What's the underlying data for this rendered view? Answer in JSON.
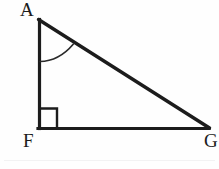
{
  "figure": {
    "kind": "geometry-diagram",
    "background_color": "#fefefe",
    "stroke_color": "#1c1c1c",
    "stroke_width": 3,
    "canvas": {
      "width": 219,
      "height": 169
    },
    "vertices": [
      {
        "id": "A",
        "label": "A",
        "x": 38,
        "y": 19,
        "label_x": 20,
        "label_y": 0
      },
      {
        "id": "F",
        "label": "F",
        "x": 38,
        "y": 128,
        "label_x": 23,
        "label_y": 131
      },
      {
        "id": "G",
        "label": "G",
        "x": 209,
        "y": 128,
        "label_x": 204,
        "label_y": 131
      }
    ],
    "segments": [
      {
        "name": "leg-AF",
        "from": "A",
        "to": "F"
      },
      {
        "name": "leg-FG",
        "from": "F",
        "to": "G"
      },
      {
        "name": "hypotenuse-AG",
        "from": "A",
        "to": "G"
      }
    ],
    "right_angle_marker": {
      "at_vertex": "F",
      "size": 19,
      "x": 38,
      "y": 108
    },
    "angle_arc": {
      "at_vertex": "A",
      "radius": 42,
      "start_x": 40,
      "start_y": 61,
      "end_x": 73,
      "end_y": 44
    }
  }
}
